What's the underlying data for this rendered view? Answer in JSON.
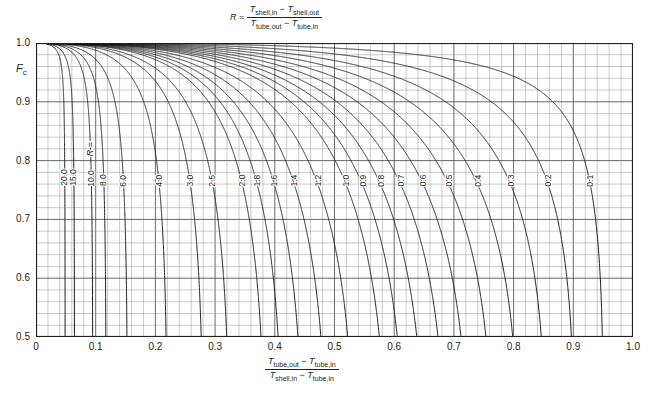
{
  "chart_data": {
    "type": "line",
    "title": "",
    "xlabel": "(T_tube,out - T_tube,in) / (T_shell,in - T_tube,in)",
    "ylabel": "Fc",
    "xlim": [
      0,
      1.0
    ],
    "ylim": [
      0.5,
      1.0
    ],
    "grid": true,
    "x_ticks": [
      "0",
      "0.1",
      "0.2",
      "0.3",
      "0.4",
      "0.5",
      "0.6",
      "0.7",
      "0.8",
      "0.9",
      "1.0"
    ],
    "y_ticks": [
      "0.5",
      "0.6",
      "0.7",
      "0.8",
      "0.9",
      "1.0"
    ],
    "x_minor_step": 0.02,
    "y_minor_step": 0.02,
    "parameter_symbol": "R",
    "parameter_prefix": "R =",
    "legend_position": "inline-curve-labels",
    "series": [
      {
        "name": "20.0",
        "R": 20.0
      },
      {
        "name": "15.0",
        "R": 15.0
      },
      {
        "name": "10.0",
        "R": 10.0
      },
      {
        "name": "8.0",
        "R": 8.0
      },
      {
        "name": "6.0",
        "R": 6.0
      },
      {
        "name": "4.0",
        "R": 4.0
      },
      {
        "name": "3.0",
        "R": 3.0
      },
      {
        "name": "2.5",
        "R": 2.5
      },
      {
        "name": "2.0",
        "R": 2.0
      },
      {
        "name": "1.8",
        "R": 1.8
      },
      {
        "name": "1.6",
        "R": 1.6
      },
      {
        "name": "1.4",
        "R": 1.4
      },
      {
        "name": "1.2",
        "R": 1.2
      },
      {
        "name": "1.0",
        "R": 1.0
      },
      {
        "name": "0.9",
        "R": 0.9
      },
      {
        "name": "0.8",
        "R": 0.8
      },
      {
        "name": "0.7",
        "R": 0.7
      },
      {
        "name": "0.6",
        "R": 0.6
      },
      {
        "name": "0.5",
        "R": 0.5
      },
      {
        "name": "0.4",
        "R": 0.4
      },
      {
        "name": "0.3",
        "R": 0.3
      },
      {
        "name": "0.2",
        "R": 0.2
      },
      {
        "name": "0.1",
        "R": 0.1
      }
    ]
  },
  "axes": {
    "y_label_text": "F",
    "y_label_sub": "c",
    "x_ticks": [
      "0",
      "0.1",
      "0.2",
      "0.3",
      "0.4",
      "0.5",
      "0.6",
      "0.7",
      "0.8",
      "0.9",
      "1.0"
    ],
    "y_ticks": [
      "1.0",
      "0.9",
      "0.8",
      "0.7",
      "0.6",
      "0.5"
    ]
  },
  "top_formula": {
    "lhs": "R",
    "equals": "=",
    "num_a": "T",
    "num_a_sub": "shell,in",
    "minus": "−",
    "num_b": "T",
    "num_b_sub": "shell,out",
    "den_a": "T",
    "den_a_sub": "tube,out",
    "den_b": "T",
    "den_b_sub": "tube,in"
  },
  "bottom_formula": {
    "num_a": "T",
    "num_a_sub": "tube,out",
    "minus": "−",
    "num_b": "T",
    "num_b_sub": "tube,in",
    "den_a": "T",
    "den_a_sub": "shell,in",
    "den_b": "T",
    "den_b_sub": "tube,in"
  },
  "curve_labels": {
    "r_prefix": "R",
    "r_equals": "=",
    "values": [
      "20.0",
      "15.0",
      "10.0",
      "8.0",
      "6.0",
      "4.0",
      "3.0",
      "2.5",
      "2.0",
      "1.8",
      "1.6",
      "1.4",
      "1.2",
      "1.0",
      "0.9",
      "0.8",
      "0.7",
      "0.6",
      "0.5",
      "0.4",
      "0.3",
      "0.2",
      "0.1"
    ]
  },
  "colors": {
    "curve": "#231f20",
    "grid_major": "#58585b",
    "grid_minor": "#939598",
    "frame": "#231f20",
    "text": "#231f20",
    "background": "#ffffff"
  }
}
